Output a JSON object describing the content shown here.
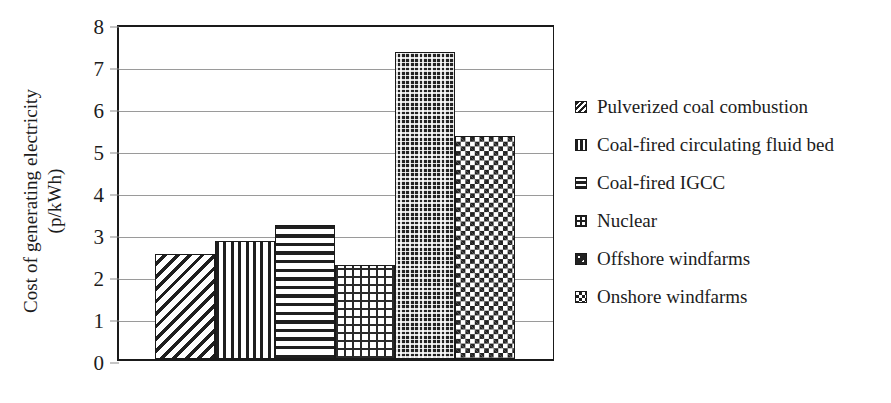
{
  "chart_data": {
    "type": "bar",
    "title": "",
    "xlabel": "",
    "ylabel": "Cost of generating electricity\n(p/kWh)",
    "ylabel_line1": "Cost of generating electricity",
    "ylabel_line2": "(p/kWh)",
    "ylim": [
      0,
      8
    ],
    "ytick_labels": [
      "0",
      "1",
      "2",
      "3",
      "4",
      "5",
      "6",
      "7",
      "8"
    ],
    "ytick_values": [
      0,
      1,
      2,
      3,
      4,
      5,
      6,
      7,
      8
    ],
    "grid": true,
    "grid_axis": "y",
    "legend_position": "right",
    "categories": [
      "Pulverized coal combustion",
      "Coal-fired circulating fluid bed",
      "Coal-fired IGCC",
      "Nuclear",
      "Offshore windfarms",
      "Onshore windfarms"
    ],
    "values": [
      2.5,
      2.8,
      3.2,
      2.25,
      7.3,
      5.3
    ],
    "bar_patterns": [
      "diagonal-hatch",
      "vertical-lines",
      "horizontal-lines",
      "crosshatch-grid",
      "dense-dark-dots",
      "checkerboard"
    ],
    "bar_color": "#1a1a1a",
    "grid_color": "#9a9a9a",
    "axis_color": "#1a1a1a",
    "bars_contiguous": true
  },
  "legend": {
    "items": [
      {
        "label": "Pulverized coal combustion",
        "pattern": "diagonal-hatch"
      },
      {
        "label": "Coal-fired circulating fluid bed",
        "pattern": "vertical-lines"
      },
      {
        "label": "Coal-fired IGCC",
        "pattern": "horizontal-lines"
      },
      {
        "label": "Nuclear",
        "pattern": "crosshatch-grid"
      },
      {
        "label": "Offshore windfarms",
        "pattern": "dense-dark-dots"
      },
      {
        "label": "Onshore windfarms",
        "pattern": "checkerboard"
      }
    ]
  }
}
